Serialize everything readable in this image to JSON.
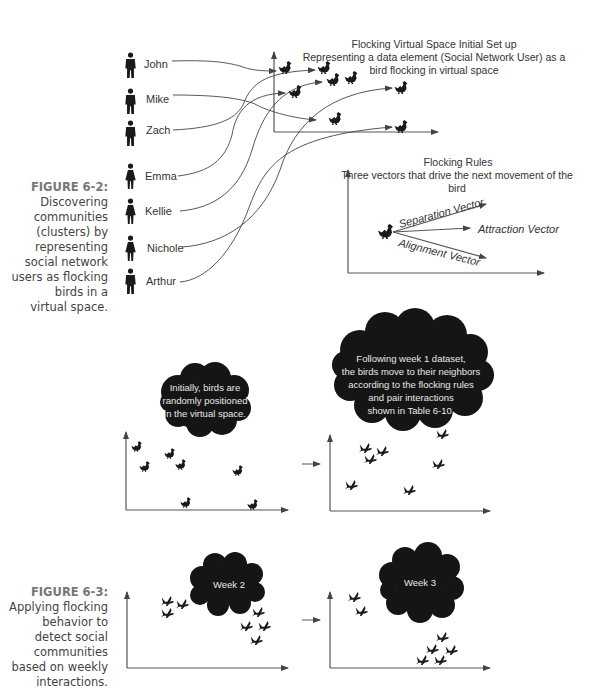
{
  "figure_6_2": {
    "caption_label": "FIGURE 6-2:",
    "caption_lines": [
      "Discovering",
      "communities",
      "(clusters) by",
      "representing",
      "social network",
      "users as flocking",
      "birds in a",
      "virtual space."
    ],
    "title_lines": [
      "Flocking Virtual Space Initial Set up",
      "Representing a data element (Social Network User) as a",
      "bird flocking in virtual space"
    ],
    "users": [
      {
        "name": "John",
        "gender": "male"
      },
      {
        "name": "Mike",
        "gender": "male"
      },
      {
        "name": "Zach",
        "gender": "male"
      },
      {
        "name": "Emma",
        "gender": "female"
      },
      {
        "name": "Kellie",
        "gender": "female"
      },
      {
        "name": "Nichole",
        "gender": "female"
      },
      {
        "name": "Arthur",
        "gender": "male"
      }
    ],
    "rules": {
      "title": "Flocking Rules",
      "subtitle_lines": [
        "Three vectors that drive the next movement of the",
        "bird"
      ],
      "vectors": [
        "Separation Vector",
        "Attraction Vector",
        "Alignment Vector"
      ]
    }
  },
  "figure_6_3": {
    "caption_label": "FIGURE 6-3:",
    "caption_lines": [
      "Applying flocking",
      "behavior to",
      "detect social",
      "communities",
      "based on weekly",
      "interactions."
    ],
    "panels": [
      {
        "cloud_lines": [
          "Initially, birds are",
          "randomly positioned",
          "in the virtual space."
        ]
      },
      {
        "cloud_lines": [
          "Following week 1 dataset,",
          "the birds move to their neighbors",
          "according to the flocking rules",
          "and pair interactions",
          "shown in Table 6-10."
        ]
      },
      {
        "cloud_lines": [
          "Week 2"
        ]
      },
      {
        "cloud_lines": [
          "Week 3"
        ]
      }
    ]
  }
}
